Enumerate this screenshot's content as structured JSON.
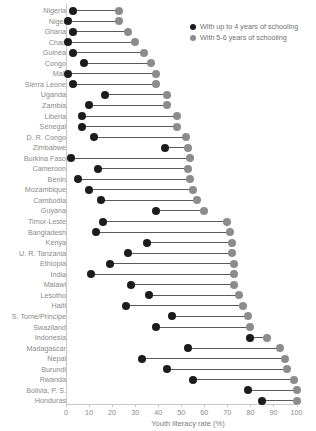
{
  "chart_data": {
    "type": "scatter",
    "subtype": "dumbbell",
    "title": "",
    "xlabel": "Youth literacy rate (%)",
    "ylabel": "",
    "xlim": [
      0,
      100
    ],
    "xticks": [
      0,
      10,
      20,
      30,
      40,
      50,
      60,
      70,
      80,
      90,
      100
    ],
    "grid": false,
    "legend_position": "top-right",
    "colors": {
      "up_to_4_years": "#1c1c1c",
      "five_to_six_years": "#8c8c8c",
      "connector": "#5a5a5a",
      "axis": "#c9c9c9",
      "text": "#8a8a8a"
    },
    "legend": [
      {
        "key": "up_to_4_years",
        "label": "With up to 4 years of schooling",
        "swatch": "dark"
      },
      {
        "key": "five_to_six_years",
        "label": "With 5-6 years of schooling",
        "swatch": "light"
      }
    ],
    "series": [
      {
        "name": "With up to 4 years of schooling",
        "key": "up_to_4_years"
      },
      {
        "name": "With 5-6 years of schooling",
        "key": "five_to_six_years"
      }
    ],
    "categories": [
      "Nigeria",
      "Niger",
      "Ghana",
      "Chad",
      "Guinea",
      "Congo",
      "Mali",
      "Sierra Leone",
      "Uganda",
      "Zambia",
      "Liberia",
      "Senegal",
      "D. R. Congo",
      "Zimbabwe",
      "Burkina Faso",
      "Cameroon",
      "Benin",
      "Mozambique",
      "Cambodia",
      "Guyana",
      "Timor-Leste",
      "Bangladesh",
      "Kenya",
      "U. R. Tanzania",
      "Ethiopia",
      "India",
      "Malawi",
      "Lesotho",
      "Haiti",
      "S. Tome/Principe",
      "Swaziland",
      "Indonesia",
      "Madagascar",
      "Nepal",
      "Burundi",
      "Rwanda",
      "Bolivia, P. S.",
      "Honduras"
    ],
    "rows": [
      {
        "label": "Nigeria",
        "up_to_4_years": 3,
        "five_to_six_years": 23
      },
      {
        "label": "Niger",
        "up_to_4_years": 1,
        "five_to_six_years": 23
      },
      {
        "label": "Ghana",
        "up_to_4_years": 3,
        "five_to_six_years": 27
      },
      {
        "label": "Chad",
        "up_to_4_years": 1,
        "five_to_six_years": 30
      },
      {
        "label": "Guinea",
        "up_to_4_years": 3,
        "five_to_six_years": 34
      },
      {
        "label": "Congo",
        "up_to_4_years": 8,
        "five_to_six_years": 37
      },
      {
        "label": "Mali",
        "up_to_4_years": 1,
        "five_to_six_years": 39
      },
      {
        "label": "Sierra Leone",
        "up_to_4_years": 3,
        "five_to_six_years": 39
      },
      {
        "label": "Uganda",
        "up_to_4_years": 17,
        "five_to_six_years": 44
      },
      {
        "label": "Zambia",
        "up_to_4_years": 10,
        "five_to_six_years": 44
      },
      {
        "label": "Liberia",
        "up_to_4_years": 7,
        "five_to_six_years": 48
      },
      {
        "label": "Senegal",
        "up_to_4_years": 7,
        "five_to_six_years": 48
      },
      {
        "label": "D. R. Congo",
        "up_to_4_years": 12,
        "five_to_six_years": 52
      },
      {
        "label": "Zimbabwe",
        "up_to_4_years": 43,
        "five_to_six_years": 53
      },
      {
        "label": "Burkina Faso",
        "up_to_4_years": 2,
        "five_to_six_years": 54
      },
      {
        "label": "Cameroon",
        "up_to_4_years": 14,
        "five_to_six_years": 53
      },
      {
        "label": "Benin",
        "up_to_4_years": 5,
        "five_to_six_years": 54
      },
      {
        "label": "Mozambique",
        "up_to_4_years": 10,
        "five_to_six_years": 55
      },
      {
        "label": "Cambodia",
        "up_to_4_years": 15,
        "five_to_six_years": 57
      },
      {
        "label": "Guyana",
        "up_to_4_years": 39,
        "five_to_six_years": 60
      },
      {
        "label": "Timor-Leste",
        "up_to_4_years": 16,
        "five_to_six_years": 70
      },
      {
        "label": "Bangladesh",
        "up_to_4_years": 13,
        "five_to_six_years": 71
      },
      {
        "label": "Kenya",
        "up_to_4_years": 35,
        "five_to_six_years": 72
      },
      {
        "label": "U. R. Tanzania",
        "up_to_4_years": 27,
        "five_to_six_years": 72
      },
      {
        "label": "Ethiopia",
        "up_to_4_years": 19,
        "five_to_six_years": 73
      },
      {
        "label": "India",
        "up_to_4_years": 11,
        "five_to_six_years": 73
      },
      {
        "label": "Malawi",
        "up_to_4_years": 28,
        "five_to_six_years": 73
      },
      {
        "label": "Lesotho",
        "up_to_4_years": 36,
        "five_to_six_years": 75
      },
      {
        "label": "Haiti",
        "up_to_4_years": 26,
        "five_to_six_years": 77
      },
      {
        "label": "S. Tome/Principe",
        "up_to_4_years": 46,
        "five_to_six_years": 79
      },
      {
        "label": "Swaziland",
        "up_to_4_years": 39,
        "five_to_six_years": 80
      },
      {
        "label": "Indonesia",
        "up_to_4_years": 80,
        "five_to_six_years": 87
      },
      {
        "label": "Madagascar",
        "up_to_4_years": 53,
        "five_to_six_years": 93
      },
      {
        "label": "Nepal",
        "up_to_4_years": 33,
        "five_to_six_years": 95
      },
      {
        "label": "Burundi",
        "up_to_4_years": 44,
        "five_to_six_years": 96
      },
      {
        "label": "Rwanda",
        "up_to_4_years": 55,
        "five_to_six_years": 99
      },
      {
        "label": "Bolivia, P. S.",
        "up_to_4_years": 79,
        "five_to_six_years": 100
      },
      {
        "label": "Honduras",
        "up_to_4_years": 85,
        "five_to_six_years": 100
      }
    ]
  }
}
